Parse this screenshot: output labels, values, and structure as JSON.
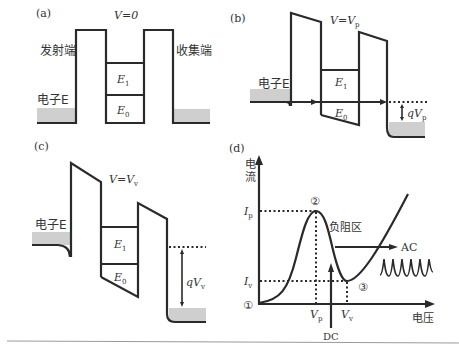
{
  "panels": {
    "a": {
      "tag": "(a)",
      "voltage_label": "V=0",
      "emitter_label": "发射端",
      "collector_label": "收集端",
      "electron_label": "电子E",
      "levels": [
        "E1",
        "E0"
      ]
    },
    "b": {
      "tag": "(b)",
      "voltage_label_prefix": "V=V",
      "voltage_label_sub": "p",
      "electron_label": "电子E",
      "levels": [
        "E1",
        "E0"
      ],
      "drop_label_prefix": "qV",
      "drop_label_sub": "p"
    },
    "c": {
      "tag": "(c)",
      "voltage_label_prefix": "V=V",
      "voltage_label_sub": "v",
      "electron_label": "电子E",
      "levels": [
        "E1",
        "E0"
      ],
      "drop_label_prefix": "qV",
      "drop_label_sub": "v"
    },
    "d": {
      "tag": "(d)",
      "y_axis_label_1": "电",
      "y_axis_label_2": "流",
      "x_axis_label": "电压",
      "ip_label": "I",
      "ip_sub": "p",
      "iv_label": "I",
      "iv_sub": "v",
      "vp_label": "V",
      "vp_sub": "p",
      "vv_label": "V",
      "vv_sub": "v",
      "point_1": "①",
      "point_2": "②",
      "point_3": "③",
      "ndr_label": "负阻区",
      "ac_label": "AC",
      "dc_label": "DC"
    }
  },
  "colors": {
    "line": "#2a2a2a",
    "fill_gray": "#cfcfcf",
    "text": "#333333"
  }
}
